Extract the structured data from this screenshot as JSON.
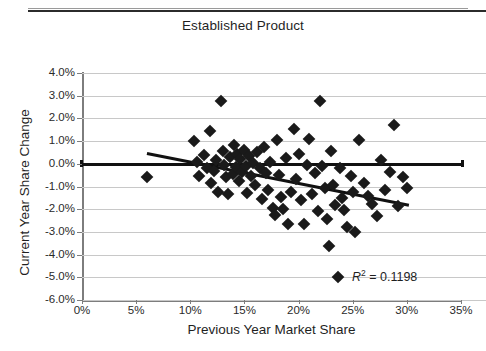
{
  "header": {
    "cut_off_title": "",
    "chart_title": "Established Product"
  },
  "chart_data": {
    "type": "scatter",
    "title": "Established Product",
    "xlabel": "Previous Year Market Share",
    "ylabel": "Current Year Share Change",
    "xlim": [
      0,
      35
    ],
    "ylim": [
      -6,
      4
    ],
    "grid": true,
    "legend": null,
    "x_ticks": [
      "0%",
      "5%",
      "10%",
      "15%",
      "20%",
      "25%",
      "30%",
      "35%"
    ],
    "x_tick_values": [
      0,
      5,
      10,
      15,
      20,
      25,
      30,
      35
    ],
    "y_ticks": [
      "4.0%",
      "3.0%",
      "2.0%",
      "1.0%",
      "0.0%",
      "-1.0%",
      "-2.0%",
      "-3.0%",
      "-4.0%",
      "-5.0%",
      "-6.0%"
    ],
    "y_tick_values": [
      4,
      3,
      2,
      1,
      0,
      -1,
      -2,
      -3,
      -4,
      -5,
      -6
    ],
    "annotation": "R² = 0.1198",
    "r_squared": 0.1198,
    "marker": "diamond",
    "marker_color": "#1a1a1a",
    "trendline": {
      "color": "#111111",
      "x_start": 6.0,
      "y_start": 0.5,
      "x_end": 30.2,
      "y_end": -1.78
    },
    "points": [
      [
        6.0,
        -0.6
      ],
      [
        10.3,
        1.0
      ],
      [
        10.6,
        0.1
      ],
      [
        10.8,
        -0.55
      ],
      [
        11.3,
        0.4
      ],
      [
        11.5,
        -0.2
      ],
      [
        11.8,
        1.45
      ],
      [
        11.9,
        -0.85
      ],
      [
        12.2,
        -0.3
      ],
      [
        12.4,
        0.15
      ],
      [
        12.6,
        -1.25
      ],
      [
        12.8,
        2.78
      ],
      [
        13.0,
        0.55
      ],
      [
        13.1,
        -0.05
      ],
      [
        13.3,
        -0.6
      ],
      [
        13.5,
        -1.35
      ],
      [
        13.7,
        0.3
      ],
      [
        13.9,
        -0.45
      ],
      [
        14.0,
        0.85
      ],
      [
        14.2,
        -0.15
      ],
      [
        14.3,
        0.45
      ],
      [
        14.5,
        -0.75
      ],
      [
        14.6,
        0.2
      ],
      [
        14.8,
        -0.35
      ],
      [
        15.0,
        0.6
      ],
      [
        15.1,
        -0.1
      ],
      [
        15.2,
        -1.3
      ],
      [
        15.4,
        0.35
      ],
      [
        15.6,
        -0.55
      ],
      [
        15.8,
        0.05
      ],
      [
        16.0,
        -0.95
      ],
      [
        16.2,
        0.5
      ],
      [
        16.4,
        -0.2
      ],
      [
        16.6,
        -1.55
      ],
      [
        16.8,
        0.75
      ],
      [
        17.0,
        -0.4
      ],
      [
        17.2,
        -1.15
      ],
      [
        17.4,
        0.1
      ],
      [
        17.6,
        -1.95
      ],
      [
        17.8,
        -2.25
      ],
      [
        18.0,
        1.05
      ],
      [
        18.2,
        -0.5
      ],
      [
        18.4,
        -1.45
      ],
      [
        18.6,
        -2.0
      ],
      [
        18.8,
        0.25
      ],
      [
        19.0,
        -2.65
      ],
      [
        19.3,
        -1.25
      ],
      [
        19.6,
        1.55
      ],
      [
        19.8,
        -0.65
      ],
      [
        20.0,
        0.45
      ],
      [
        20.2,
        -1.6
      ],
      [
        20.5,
        -2.65
      ],
      [
        20.8,
        -0.05
      ],
      [
        21.0,
        1.1
      ],
      [
        21.2,
        -1.35
      ],
      [
        21.5,
        -0.4
      ],
      [
        21.8,
        -2.1
      ],
      [
        22.0,
        2.78
      ],
      [
        22.2,
        -0.1
      ],
      [
        22.4,
        -1.05
      ],
      [
        22.6,
        -2.45
      ],
      [
        22.8,
        -3.6
      ],
      [
        23.0,
        0.55
      ],
      [
        23.2,
        -0.95
      ],
      [
        23.4,
        -1.8
      ],
      [
        23.6,
        -5.0
      ],
      [
        23.8,
        -0.2
      ],
      [
        24.0,
        -1.5
      ],
      [
        24.2,
        -2.05
      ],
      [
        24.5,
        -2.8
      ],
      [
        24.8,
        -0.55
      ],
      [
        25.0,
        -1.25
      ],
      [
        25.2,
        -3.0
      ],
      [
        25.6,
        1.05
      ],
      [
        26.0,
        -0.85
      ],
      [
        26.4,
        -1.4
      ],
      [
        26.8,
        -1.75
      ],
      [
        27.2,
        -2.3
      ],
      [
        27.6,
        0.15
      ],
      [
        28.0,
        -1.15
      ],
      [
        28.4,
        -0.35
      ],
      [
        28.8,
        1.7
      ],
      [
        29.2,
        -1.85
      ],
      [
        29.6,
        -0.6
      ],
      [
        30.0,
        -1.05
      ]
    ]
  }
}
